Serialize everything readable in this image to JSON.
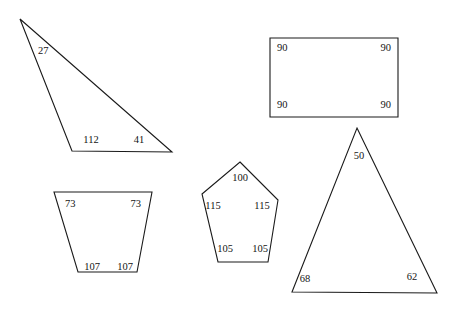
{
  "canvas": {
    "width": 461,
    "height": 309,
    "background": "#ffffff",
    "stroke_color": "#1a1a1a",
    "label_color": "#141414"
  },
  "shapes": [
    {
      "id": "scalene-triangle",
      "name": "Obtuse scalene triangle",
      "sides": 3,
      "points": "20,19 72,151 172,152",
      "angles": [
        {
          "value": "27",
          "x": 38,
          "y": 52,
          "anchor": "start"
        },
        {
          "value": "112",
          "x": 91,
          "y": 141,
          "anchor": "middle"
        },
        {
          "value": "41",
          "x": 139,
          "y": 141,
          "anchor": "middle"
        }
      ]
    },
    {
      "id": "rectangle",
      "name": "Rectangle",
      "sides": 4,
      "points": "270,38 398,38 398,117 270,117",
      "angles": [
        {
          "value": "90",
          "x": 277,
          "y": 49,
          "anchor": "start"
        },
        {
          "value": "90",
          "x": 391,
          "y": 49,
          "anchor": "end"
        },
        {
          "value": "90",
          "x": 277,
          "y": 106,
          "anchor": "start"
        },
        {
          "value": "90",
          "x": 391,
          "y": 106,
          "anchor": "end"
        }
      ]
    },
    {
      "id": "trapezoid",
      "name": "Isosceles trapezoid",
      "sides": 4,
      "points": "54,192 152,192 137,272 78,272",
      "angles": [
        {
          "value": "73",
          "x": 65,
          "y": 205,
          "anchor": "start"
        },
        {
          "value": "73",
          "x": 141,
          "y": 205,
          "anchor": "end"
        },
        {
          "value": "107",
          "x": 92,
          "y": 268,
          "anchor": "middle"
        },
        {
          "value": "107",
          "x": 125,
          "y": 268,
          "anchor": "middle"
        }
      ]
    },
    {
      "id": "pentagon",
      "name": "Irregular pentagon",
      "sides": 5,
      "points": "240,162 278,200 268,262 218,262 202,194",
      "angles": [
        {
          "value": "100",
          "x": 240,
          "y": 179,
          "anchor": "middle"
        },
        {
          "value": "115",
          "x": 213,
          "y": 207,
          "anchor": "middle"
        },
        {
          "value": "115",
          "x": 262,
          "y": 207,
          "anchor": "middle"
        },
        {
          "value": "105",
          "x": 225,
          "y": 250,
          "anchor": "middle"
        },
        {
          "value": "105",
          "x": 260,
          "y": 250,
          "anchor": "middle"
        }
      ]
    },
    {
      "id": "acute-triangle",
      "name": "Acute triangle",
      "sides": 3,
      "points": "357,128 437,293 292,292",
      "angles": [
        {
          "value": "50",
          "x": 359,
          "y": 157,
          "anchor": "middle"
        },
        {
          "value": "68",
          "x": 305,
          "y": 280,
          "anchor": "middle"
        },
        {
          "value": "62",
          "x": 412,
          "y": 278,
          "anchor": "middle"
        }
      ]
    }
  ]
}
